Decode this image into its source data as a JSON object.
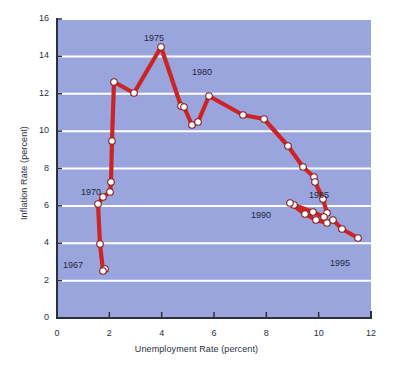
{
  "chart_data": {
    "type": "line",
    "title": "",
    "subtitle": "",
    "xlabel": "Unemployment Rate (percent)",
    "ylabel": "Inflation Rate (percent)",
    "xlim": [
      0,
      12
    ],
    "ylim": [
      0,
      16
    ],
    "xticks": [
      "0",
      "2",
      "4",
      "6",
      "8",
      "10",
      "12"
    ],
    "yticks": [
      "0",
      "2",
      "4",
      "6",
      "8",
      "10",
      "12",
      "14",
      "16"
    ],
    "grid": "horizontal",
    "legend": "none",
    "series": [
      {
        "name": "Phillips curve path",
        "line_color": "#cc2424",
        "marker_color": "#ffffff",
        "marker_edge_color": "#8a1c1c",
        "points": [
          {
            "year": "1967",
            "x": 3.8,
            "y": 3.4
          },
          {
            "year": "1968",
            "x": 3.6,
            "y": 4.2
          },
          {
            "year": "1969",
            "x": 3.5,
            "y": 5.4
          },
          {
            "year": "1970",
            "x": 4.9,
            "y": 5.9
          },
          {
            "year": "1971",
            "x": 5.9,
            "y": 4.3
          },
          {
            "year": "1972",
            "x": 5.6,
            "y": 3.3
          },
          {
            "year": "1973",
            "x": 4.9,
            "y": 6.2
          },
          {
            "year": "1974",
            "x": 5.6,
            "y": 11.0
          },
          {
            "year": "1975",
            "x": 8.5,
            "y": 9.1
          },
          {
            "year": "1976",
            "x": 7.7,
            "y": 5.8
          },
          {
            "year": "1977",
            "x": 7.1,
            "y": 6.5
          },
          {
            "year": "1978",
            "x": 6.1,
            "y": 7.7
          },
          {
            "year": "1979",
            "x": 5.8,
            "y": 11.3
          },
          {
            "year": "1980",
            "x": 7.1,
            "y": 13.5
          },
          {
            "year": "1981",
            "x": 7.6,
            "y": 10.3
          },
          {
            "year": "1982",
            "x": 9.7,
            "y": 6.2
          },
          {
            "year": "1983",
            "x": 9.6,
            "y": 3.2
          },
          {
            "year": "1984",
            "x": 7.5,
            "y": 4.3
          },
          {
            "year": "1985",
            "x": 7.2,
            "y": 3.6
          },
          {
            "year": "1990",
            "x": 5.6,
            "y": 5.4
          },
          {
            "year": "1995",
            "x": 5.6,
            "y": 2.8
          }
        ],
        "pixel_points": [
          [
            105,
            269
          ],
          [
            103,
            271
          ],
          [
            100,
            244
          ],
          [
            98,
            204
          ],
          [
            103,
            197
          ],
          [
            110,
            192
          ],
          [
            111,
            182
          ],
          [
            112,
            141
          ],
          [
            114,
            82
          ],
          [
            134,
            93
          ],
          [
            161,
            47
          ],
          [
            181,
            106
          ],
          [
            184,
            107
          ],
          [
            192,
            125
          ],
          [
            198,
            122
          ],
          [
            209,
            96
          ],
          [
            243,
            115
          ],
          [
            264,
            119
          ],
          [
            288,
            146
          ],
          [
            303,
            167
          ],
          [
            314,
            177
          ],
          [
            315,
            182
          ],
          [
            323,
            199
          ],
          [
            327,
            213
          ],
          [
            324,
            217
          ],
          [
            313,
            212
          ],
          [
            294,
            205
          ],
          [
            290,
            203
          ],
          [
            305,
            214
          ],
          [
            316,
            220
          ],
          [
            327,
            223
          ],
          [
            333,
            220
          ],
          [
            342,
            229
          ],
          [
            358,
            238
          ]
        ]
      }
    ],
    "annotations": [
      {
        "text": "1967",
        "x_px": 63,
        "y_px": 260
      },
      {
        "text": "1970",
        "x_px": 81,
        "y_px": 187
      },
      {
        "text": "1975",
        "x_px": 144,
        "y_px": 33
      },
      {
        "text": "1980",
        "x_px": 192,
        "y_px": 67
      },
      {
        "text": "1985",
        "x_px": 309,
        "y_px": 190
      },
      {
        "text": "1990",
        "x_px": 251,
        "y_px": 210
      },
      {
        "text": "1995",
        "x_px": 330,
        "y_px": 258
      }
    ],
    "colors": {
      "plot_background": "#9aa5dd",
      "gridline": "#ffffff",
      "line": "#cc2424",
      "marker_fill": "#ffffff",
      "marker_edge": "#8a1c1c",
      "axis": "#2b3040",
      "text": "#2b3040",
      "page_background": "#ffffff"
    },
    "geometry": {
      "plot_left_px": 57,
      "plot_right_px": 371,
      "plot_top_px": 19,
      "plot_bottom_px": 318
    }
  }
}
